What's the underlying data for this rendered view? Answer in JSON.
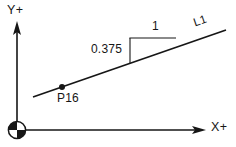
{
  "figure": {
    "kind": "coordinate-geometry-diagram",
    "background_color": "#ffffff",
    "stroke_color": "#161616",
    "text_color": "#161616",
    "width": 236,
    "height": 147
  },
  "axes": {
    "origin_symbol_name": "quadrant-origin-marker",
    "origin": {
      "x": 17,
      "y": 130,
      "radius": 9
    },
    "y_axis": {
      "label": "Y+",
      "from": {
        "x": 17,
        "y": 130
      },
      "to": {
        "x": 17,
        "y": 22
      },
      "arrow": "up"
    },
    "x_axis": {
      "label": "X+",
      "from": {
        "x": 17,
        "y": 130
      },
      "to": {
        "x": 206,
        "y": 130
      },
      "arrow": "right"
    }
  },
  "line": {
    "name": "L1",
    "label": "L1",
    "from": {
      "x": 33,
      "y": 97
    },
    "to": {
      "x": 226,
      "y": 30
    },
    "label_rotation_deg": -19
  },
  "point": {
    "name": "P16",
    "label": "P16",
    "at": {
      "x": 62,
      "y": 87
    },
    "marker": "filled-dot",
    "marker_radius": 3
  },
  "slope_triangle": {
    "rise_label": "0.375",
    "run_label": "1",
    "vertical_leg": {
      "x": 130,
      "y_top": 38,
      "y_bottom": 63
    },
    "horizontal_leg": {
      "y": 38,
      "x_left": 130,
      "x_right": 176
    },
    "hypotenuse_is_line": "L1"
  }
}
